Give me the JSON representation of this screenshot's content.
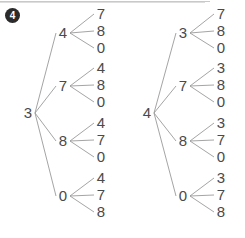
{
  "problem": {
    "number": "4",
    "badge_bg": "#2b2b2b",
    "badge_fg": "#ffffff"
  },
  "style": {
    "edge_color": "#9a9a9a",
    "text_color": "#4a4a4a",
    "page_bg": "#ffffff"
  },
  "diagram_type": "tree-diagram",
  "trees": [
    {
      "id": "left-tree",
      "root": "3",
      "root_pos": {
        "x": 28,
        "y": 113
      },
      "branches": [
        {
          "label": "4",
          "pos": {
            "x": 63,
            "y": 33
          },
          "leaves": [
            {
              "label": "7",
              "pos": {
                "x": 101,
                "y": 14
              }
            },
            {
              "label": "8",
              "pos": {
                "x": 101,
                "y": 31
              }
            },
            {
              "label": "0",
              "pos": {
                "x": 101,
                "y": 48
              }
            }
          ]
        },
        {
          "label": "7",
          "pos": {
            "x": 63,
            "y": 86
          },
          "leaves": [
            {
              "label": "4",
              "pos": {
                "x": 101,
                "y": 68
              }
            },
            {
              "label": "8",
              "pos": {
                "x": 101,
                "y": 85
              }
            },
            {
              "label": "0",
              "pos": {
                "x": 101,
                "y": 102
              }
            }
          ]
        },
        {
          "label": "8",
          "pos": {
            "x": 63,
            "y": 141
          },
          "leaves": [
            {
              "label": "4",
              "pos": {
                "x": 101,
                "y": 123
              }
            },
            {
              "label": "7",
              "pos": {
                "x": 101,
                "y": 140
              }
            },
            {
              "label": "0",
              "pos": {
                "x": 101,
                "y": 157
              }
            }
          ]
        },
        {
          "label": "0",
          "pos": {
            "x": 63,
            "y": 196
          },
          "leaves": [
            {
              "label": "4",
              "pos": {
                "x": 101,
                "y": 178
              }
            },
            {
              "label": "7",
              "pos": {
                "x": 101,
                "y": 195
              }
            },
            {
              "label": "8",
              "pos": {
                "x": 101,
                "y": 212
              }
            }
          ]
        }
      ]
    },
    {
      "id": "right-tree",
      "root": "4",
      "root_pos": {
        "x": 147,
        "y": 113
      },
      "branches": [
        {
          "label": "3",
          "pos": {
            "x": 183,
            "y": 33
          },
          "leaves": [
            {
              "label": "7",
              "pos": {
                "x": 221,
                "y": 14
              }
            },
            {
              "label": "8",
              "pos": {
                "x": 221,
                "y": 31
              }
            },
            {
              "label": "0",
              "pos": {
                "x": 221,
                "y": 48
              }
            }
          ]
        },
        {
          "label": "7",
          "pos": {
            "x": 183,
            "y": 86
          },
          "leaves": [
            {
              "label": "3",
              "pos": {
                "x": 221,
                "y": 68
              }
            },
            {
              "label": "8",
              "pos": {
                "x": 221,
                "y": 85
              }
            },
            {
              "label": "0",
              "pos": {
                "x": 221,
                "y": 102
              }
            }
          ]
        },
        {
          "label": "8",
          "pos": {
            "x": 183,
            "y": 141
          },
          "leaves": [
            {
              "label": "3",
              "pos": {
                "x": 221,
                "y": 123
              }
            },
            {
              "label": "7",
              "pos": {
                "x": 221,
                "y": 140
              }
            },
            {
              "label": "0",
              "pos": {
                "x": 221,
                "y": 157
              }
            }
          ]
        },
        {
          "label": "0",
          "pos": {
            "x": 183,
            "y": 196
          },
          "leaves": [
            {
              "label": "3",
              "pos": {
                "x": 221,
                "y": 178
              }
            },
            {
              "label": "7",
              "pos": {
                "x": 221,
                "y": 195
              }
            },
            {
              "label": "8",
              "pos": {
                "x": 221,
                "y": 212
              }
            }
          ]
        }
      ]
    }
  ]
}
